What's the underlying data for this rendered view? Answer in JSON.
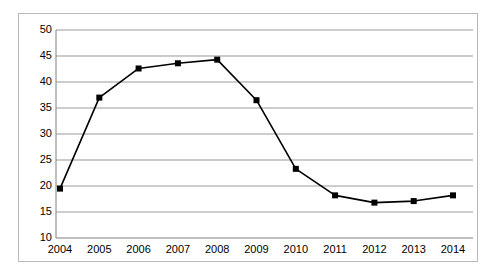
{
  "chart_data": {
    "type": "line",
    "title": "",
    "subtitle": "",
    "xlabel": "",
    "ylabel": "",
    "categories": [
      "2004",
      "2005",
      "2006",
      "2007",
      "2008",
      "2009",
      "2010",
      "2011",
      "2012",
      "2013",
      "2014"
    ],
    "x": [
      2004,
      2005,
      2006,
      2007,
      2008,
      2009,
      2010,
      2011,
      2012,
      2013,
      2014
    ],
    "values": [
      19.5,
      37.0,
      42.6,
      43.6,
      44.3,
      36.5,
      23.3,
      18.2,
      16.8,
      17.1,
      18.2
    ],
    "series": [
      {
        "name": "",
        "values": [
          19.5,
          37.0,
          42.6,
          43.6,
          44.3,
          36.5,
          23.3,
          18.2,
          16.8,
          17.1,
          18.2
        ]
      }
    ],
    "ylim": [
      10,
      50
    ],
    "xlim": [
      2004,
      2014
    ],
    "y_ticks": [
      10,
      15,
      20,
      25,
      30,
      35,
      40,
      45,
      50
    ],
    "y_tick_labels": [
      "10",
      "15",
      "20",
      "25",
      "30",
      "35",
      "40",
      "45",
      "50"
    ],
    "x_tick_labels": [
      "2004",
      "2005",
      "2006",
      "2007",
      "2008",
      "2009",
      "2010",
      "2011",
      "2012",
      "2013",
      "2014"
    ],
    "grid": true,
    "grid_axis": "y",
    "legend": false,
    "legend_position": "none",
    "marker": "square",
    "line_color": "#000000",
    "marker_color": "#000000",
    "grid_color": "#999999",
    "axis_color": "#808080",
    "frame_color": "#b9b9b9",
    "background_color": "#ffffff",
    "annotations": []
  }
}
